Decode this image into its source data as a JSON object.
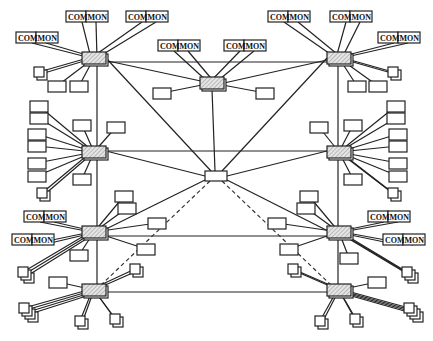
{
  "diagram": {
    "type": "network-topology",
    "label_left": "COM",
    "label_right": "MON",
    "colors": {
      "line": "#222222",
      "hub_fill": "#d8d8d8",
      "background": "#ffffff"
    },
    "hubs": [
      {
        "id": "H1",
        "x": 82,
        "y": 52
      },
      {
        "id": "H2",
        "x": 200,
        "y": 77
      },
      {
        "id": "H3",
        "x": 327,
        "y": 52
      },
      {
        "id": "H4",
        "x": 82,
        "y": 146
      },
      {
        "id": "H5",
        "x": 327,
        "y": 146
      },
      {
        "id": "H6",
        "x": 82,
        "y": 226
      },
      {
        "id": "H7",
        "x": 327,
        "y": 226
      },
      {
        "id": "H8",
        "x": 82,
        "y": 284
      },
      {
        "id": "H9",
        "x": 327,
        "y": 284
      }
    ],
    "center_node": {
      "id": "C",
      "x": 205,
      "y": 171,
      "w": 22,
      "h": 10
    },
    "backbone": [
      [
        97,
        62,
        97,
        296
      ],
      [
        338,
        62,
        338,
        296
      ],
      [
        106,
        62,
        327,
        62
      ],
      [
        106,
        151,
        327,
        151
      ],
      [
        106,
        236,
        327,
        236
      ],
      [
        106,
        292,
        327,
        292
      ]
    ],
    "center_links": [
      [
        94,
        58,
        210,
        83
      ],
      [
        336,
        58,
        224,
        83
      ],
      [
        212,
        89,
        215,
        171
      ],
      [
        106,
        58,
        211,
        171
      ],
      [
        327,
        58,
        222,
        171
      ],
      [
        106,
        151,
        205,
        176
      ],
      [
        327,
        151,
        227,
        176
      ],
      [
        100,
        232,
        205,
        180
      ],
      [
        330,
        232,
        227,
        180
      ]
    ],
    "dashed_links": [
      [
        210,
        181,
        100,
        286
      ],
      [
        222,
        181,
        332,
        286
      ]
    ],
    "com_mon_labels": [
      {
        "x": 66,
        "y": 11,
        "hub": "H1"
      },
      {
        "x": 126,
        "y": 11,
        "hub": "H1"
      },
      {
        "x": 16,
        "y": 32,
        "hub": "H1"
      },
      {
        "x": 158,
        "y": 40,
        "hub": "H2"
      },
      {
        "x": 224,
        "y": 40,
        "hub": "H2"
      },
      {
        "x": 268,
        "y": 11,
        "hub": "H3"
      },
      {
        "x": 330,
        "y": 11,
        "hub": "H3"
      },
      {
        "x": 378,
        "y": 32,
        "hub": "H3"
      },
      {
        "x": 24,
        "y": 211,
        "hub": "H6"
      },
      {
        "x": 12,
        "y": 234,
        "hub": "H6"
      },
      {
        "x": 368,
        "y": 211,
        "hub": "H7"
      },
      {
        "x": 383,
        "y": 234,
        "hub": "H7"
      }
    ],
    "terminals": [
      {
        "x": 48,
        "y": 81,
        "hub": "H1"
      },
      {
        "x": 70,
        "y": 81,
        "hub": "H1"
      },
      {
        "x": 153,
        "y": 88,
        "hub": "H2"
      },
      {
        "x": 256,
        "y": 88,
        "hub": "H2"
      },
      {
        "x": 348,
        "y": 81,
        "hub": "H3"
      },
      {
        "x": 369,
        "y": 81,
        "hub": "H3"
      },
      {
        "x": 30,
        "y": 101,
        "hub": "H4"
      },
      {
        "x": 30,
        "y": 113,
        "hub": "H4"
      },
      {
        "x": 28,
        "y": 129,
        "hub": "H4"
      },
      {
        "x": 28,
        "y": 141,
        "hub": "H4"
      },
      {
        "x": 28,
        "y": 158,
        "hub": "H4"
      },
      {
        "x": 28,
        "y": 171,
        "hub": "H4"
      },
      {
        "x": 73,
        "y": 120,
        "hub": "H4"
      },
      {
        "x": 107,
        "y": 122,
        "hub": "H4"
      },
      {
        "x": 73,
        "y": 174,
        "hub": "H4"
      },
      {
        "x": 387,
        "y": 101,
        "hub": "H5"
      },
      {
        "x": 387,
        "y": 113,
        "hub": "H5"
      },
      {
        "x": 389,
        "y": 129,
        "hub": "H5"
      },
      {
        "x": 389,
        "y": 141,
        "hub": "H5"
      },
      {
        "x": 389,
        "y": 158,
        "hub": "H5"
      },
      {
        "x": 389,
        "y": 171,
        "hub": "H5"
      },
      {
        "x": 310,
        "y": 122,
        "hub": "H5"
      },
      {
        "x": 344,
        "y": 120,
        "hub": "H5"
      },
      {
        "x": 344,
        "y": 174,
        "hub": "H5"
      },
      {
        "x": 115,
        "y": 191,
        "hub": "H6"
      },
      {
        "x": 118,
        "y": 203,
        "hub": "H6"
      },
      {
        "x": 148,
        "y": 218,
        "hub": "H6"
      },
      {
        "x": 137,
        "y": 244,
        "hub": "H6"
      },
      {
        "x": 70,
        "y": 250,
        "hub": "H6"
      },
      {
        "x": 300,
        "y": 191,
        "hub": "H7"
      },
      {
        "x": 297,
        "y": 203,
        "hub": "H7"
      },
      {
        "x": 268,
        "y": 218,
        "hub": "H7"
      },
      {
        "x": 280,
        "y": 244,
        "hub": "H7"
      },
      {
        "x": 340,
        "y": 253,
        "hub": "H7"
      },
      {
        "x": 49,
        "y": 277,
        "hub": "H8"
      },
      {
        "x": 368,
        "y": 277,
        "hub": "H9"
      }
    ],
    "square_devices": [
      {
        "x": 34,
        "y": 67,
        "hub": "H1",
        "stack": 2
      },
      {
        "x": 37,
        "y": 188,
        "hub": "H4",
        "stack": 2
      },
      {
        "x": 388,
        "y": 67,
        "hub": "H3",
        "stack": 2
      },
      {
        "x": 388,
        "y": 188,
        "hub": "H5",
        "stack": 2
      },
      {
        "x": 18,
        "y": 267,
        "hub": "H6",
        "stack": 3
      },
      {
        "x": 402,
        "y": 267,
        "hub": "H7",
        "stack": 3
      },
      {
        "x": 130,
        "y": 264,
        "hub": "H8",
        "stack": 2
      },
      {
        "x": 288,
        "y": 264,
        "hub": "H9",
        "stack": 2
      },
      {
        "x": 19,
        "y": 303,
        "hub": "H8",
        "stack": 4
      },
      {
        "x": 75,
        "y": 316,
        "hub": "H8",
        "stack": 2
      },
      {
        "x": 110,
        "y": 314,
        "hub": "H8",
        "stack": 2
      },
      {
        "x": 315,
        "y": 316,
        "hub": "H9",
        "stack": 2
      },
      {
        "x": 350,
        "y": 314,
        "hub": "H9",
        "stack": 2
      },
      {
        "x": 404,
        "y": 303,
        "hub": "H9",
        "stack": 4
      }
    ]
  }
}
